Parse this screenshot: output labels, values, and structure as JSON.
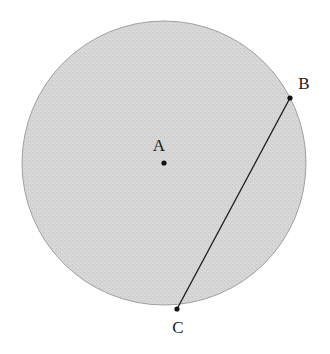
{
  "diagram": {
    "type": "circle-with-chord",
    "circle": {
      "cx": 164,
      "cy": 163,
      "r": 142,
      "fill": "#d3d3d3",
      "stroke": "#9a9a9a"
    },
    "points": [
      {
        "id": "A",
        "label": "A",
        "x": 164,
        "y": 163,
        "label_x": 159,
        "label_y": 151
      },
      {
        "id": "B",
        "label": "B",
        "x": 290,
        "y": 98,
        "label_x": 304,
        "label_y": 89
      },
      {
        "id": "C",
        "label": "C",
        "x": 177,
        "y": 309,
        "label_x": 178,
        "label_y": 333
      }
    ],
    "segments": [
      {
        "from": "B",
        "to": "C"
      }
    ]
  }
}
